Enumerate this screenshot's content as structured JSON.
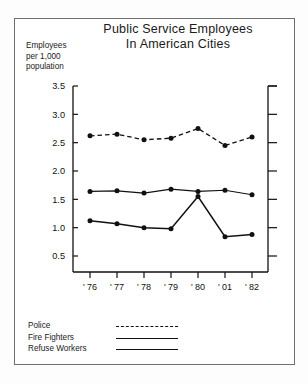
{
  "figure": {
    "title_line1": "Public Service Employees",
    "title_line2": "In American Cities",
    "axis_caption_line1": "Employees",
    "axis_caption_line2": "per 1,000",
    "axis_caption_line3": "population",
    "frame_color": "#6e6e6e",
    "ink_color": "#111111"
  },
  "legend": {
    "items": [
      {
        "label": "Police",
        "style": "dashed"
      },
      {
        "label": "Fire Fighters",
        "style": "solid-thin"
      },
      {
        "label": "Refuse Workers",
        "style": "solid-thick"
      }
    ]
  },
  "chart_data": {
    "type": "line",
    "title": "Public Service Employees In American Cities",
    "xlabel": "",
    "ylabel": "Employees per 1,000 population",
    "categories": [
      "' 76",
      "' 77",
      "' 78",
      "' 79",
      "' 80",
      "' 01",
      "' 82"
    ],
    "ytick_labels": [
      "3.5",
      "3.0",
      "2.5",
      "2.0",
      "1.5",
      "1.0",
      "0.5"
    ],
    "ytick_values": [
      3.5,
      3.0,
      2.5,
      2.0,
      1.5,
      1.0,
      0.5
    ],
    "ylim": [
      0.0,
      3.5
    ],
    "grid": false,
    "legend_position": "below-plot-left",
    "right_axis_ticks": true,
    "series": [
      {
        "name": "Police",
        "style": "dashed",
        "marker": "filled-circle",
        "values": [
          2.62,
          2.65,
          2.55,
          2.58,
          2.75,
          2.45,
          2.6
        ]
      },
      {
        "name": "Fire Fighters",
        "style": "solid-thin",
        "marker": "filled-circle",
        "values": [
          1.64,
          1.65,
          1.61,
          1.68,
          1.64,
          1.66,
          1.58
        ]
      },
      {
        "name": "Refuse Workers",
        "style": "solid-thick",
        "marker": "filled-circle",
        "values": [
          1.12,
          1.07,
          1.0,
          0.98,
          1.55,
          0.84,
          0.88
        ]
      }
    ]
  }
}
